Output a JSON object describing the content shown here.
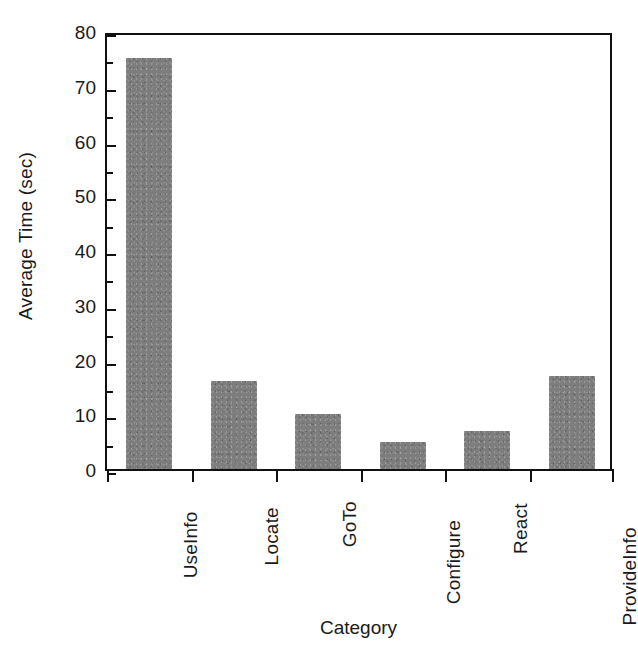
{
  "chart_data": {
    "type": "bar",
    "title": "",
    "xlabel": "Category",
    "ylabel": "Average Time (sec)",
    "categories": [
      "UseInfo",
      "Locate",
      "GoTo",
      "Configure",
      "React",
      "ProvideInfo"
    ],
    "values": [
      75,
      16,
      10,
      5,
      7,
      17
    ],
    "ylim": [
      0,
      80
    ],
    "ytick_labels": [
      "0",
      "10",
      "20",
      "30",
      "40",
      "50",
      "60",
      "70",
      "80"
    ],
    "ytick_values": [
      0,
      10,
      20,
      30,
      40,
      50,
      60,
      70,
      80
    ],
    "yminor_tick_values": [
      5,
      15,
      25,
      35,
      45,
      55,
      65,
      75
    ],
    "grid": false,
    "legend": null,
    "bar_color": "#7d7d7d",
    "axis_color": "#111111"
  }
}
